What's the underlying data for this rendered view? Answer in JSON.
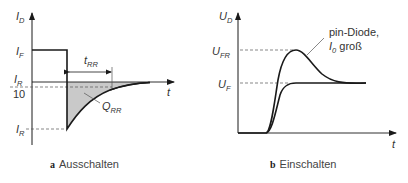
{
  "panel_a": {
    "caption_letter": "a",
    "caption": "Ausschalten",
    "y_axis_label": "I",
    "y_axis_sub": "D",
    "x_axis_label": "t",
    "level_if": "I",
    "level_if_sub": "F",
    "level_ir10_num": "I",
    "level_ir10_num_sub": "R",
    "level_ir10_den": "10",
    "level_ir": "I",
    "level_ir_sub": "R",
    "trr_label": "t",
    "trr_sub": "RR",
    "qrr_label": "Q",
    "qrr_sub": "RR",
    "shade_color": "#c8c8c8",
    "line_color": "#1a1a1a"
  },
  "panel_b": {
    "caption_letter": "b",
    "caption": "Einschalten",
    "y_axis_label": "U",
    "y_axis_sub": "D",
    "x_axis_label": "t",
    "level_ufr": "U",
    "level_ufr_sub": "FR",
    "level_uf": "U",
    "level_uf_sub": "F",
    "annotation_line1": "pin-Diode,",
    "annotation_line2_var": "I",
    "annotation_line2_sub": "0",
    "annotation_line2_text": " groß"
  }
}
